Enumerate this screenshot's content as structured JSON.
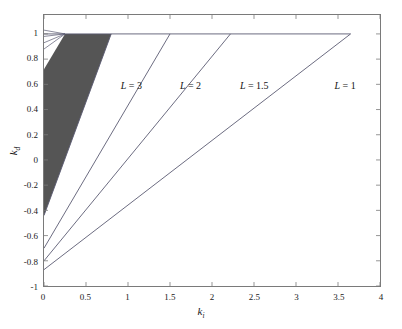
{
  "figure": {
    "background": "#ffffff",
    "frame_color": "#7a7a7a",
    "line_color": "#5a5a72",
    "fill_color": "#555555"
  },
  "axes": {
    "x": {
      "label": "k",
      "label_sub": "i",
      "min": 0,
      "max": 4,
      "ticks": [
        0,
        0.5,
        1,
        1.5,
        2,
        2.5,
        3,
        3.5,
        4
      ],
      "tick_labels": [
        "0",
        "0.5",
        "1",
        "1.5",
        "2",
        "2.5",
        "3",
        "3.5",
        "4"
      ]
    },
    "y": {
      "label": "k",
      "label_sub": "d",
      "min": -1,
      "max": 1.15,
      "ticks": [
        1,
        0.8,
        0.6,
        0.4,
        0.2,
        0,
        -0.2,
        -0.4,
        -0.6,
        -0.8,
        -1
      ],
      "tick_labels": [
        "1",
        "0.8",
        "0.6",
        "0.4",
        "0.2",
        "0",
        "-0.2",
        "-0.4",
        "-0.6",
        "-0.8",
        "-1"
      ]
    }
  },
  "annotations": [
    {
      "text": "L = 3",
      "lhs": "L",
      "rhs": "= 3",
      "x": 0.92,
      "y": 0.62
    },
    {
      "text": "L = 2",
      "lhs": "L",
      "rhs": "= 2",
      "x": 1.62,
      "y": 0.62
    },
    {
      "text": "L = 1.5",
      "lhs": "L",
      "rhs": "= 1.5",
      "x": 2.33,
      "y": 0.62
    },
    {
      "text": "L = 1",
      "lhs": "L",
      "rhs": "= 1",
      "x": 3.45,
      "y": 0.62
    }
  ],
  "chart_data": {
    "type": "line",
    "title": "",
    "xlabel": "k_i",
    "ylabel": "k_d",
    "xlim": [
      0,
      4
    ],
    "ylim": [
      -1,
      1.15
    ],
    "grid": false,
    "legend": "none",
    "series": [
      {
        "name": "L = 3",
        "L": 3,
        "kind": "boundary-line",
        "points": [
          [
            0,
            -0.44
          ],
          [
            0.8,
            1.0
          ]
        ]
      },
      {
        "name": "L = 2",
        "L": 2,
        "kind": "boundary-line",
        "points": [
          [
            0,
            -0.7
          ],
          [
            1.5,
            1.0
          ]
        ]
      },
      {
        "name": "L = 1.5",
        "L": 1.5,
        "kind": "boundary-line",
        "points": [
          [
            0,
            -0.8
          ],
          [
            2.22,
            1.0
          ]
        ]
      },
      {
        "name": "L = 1",
        "L": 1,
        "kind": "boundary-line",
        "points": [
          [
            0,
            -0.87
          ],
          [
            3.65,
            1.0
          ]
        ]
      },
      {
        "name": "ceiling k_d = 1",
        "kind": "horizontal-line",
        "points": [
          [
            0,
            1.0
          ],
          [
            3.65,
            1.0
          ]
        ]
      }
    ],
    "shaded_region": {
      "name": "stable region (L = 3)",
      "fill": "#555555",
      "vertices": [
        [
          0,
          0.72
        ],
        [
          0.25,
          1.0
        ],
        [
          0.8,
          1.0
        ],
        [
          0,
          -0.44
        ]
      ]
    },
    "fan_lines": {
      "name": "converging thin lines near origin of ceiling",
      "apex": [
        0.25,
        1.0
      ],
      "endpoints": [
        [
          0,
          1.03
        ],
        [
          0,
          0.98
        ],
        [
          0,
          0.93
        ],
        [
          0,
          0.88
        ]
      ]
    }
  }
}
